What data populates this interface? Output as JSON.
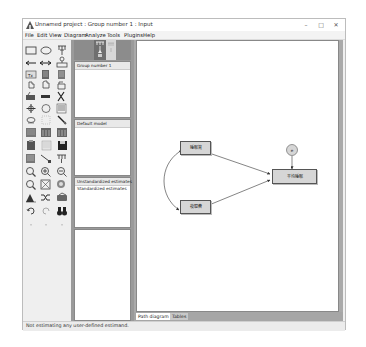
{
  "window": {
    "title": "Unnamed project : Group number 1 : Input",
    "controls": {
      "minimize": "–",
      "maximize": "□",
      "close": "✕"
    }
  },
  "menubar": {
    "items": [
      {
        "label": "File"
      },
      {
        "label": "Edit"
      },
      {
        "label": "View"
      },
      {
        "label": "Diagram"
      },
      {
        "label": "Analyze"
      },
      {
        "label": "Tools"
      },
      {
        "label": "Plugins"
      },
      {
        "label": "Help"
      }
    ]
  },
  "toolbox": {
    "icons": [
      "rectangle-observed-variable-icon",
      "ellipse-latent-variable-icon",
      "indicator-variable-icon",
      "single-arrow-path-icon",
      "double-arrow-covariance-icon",
      "unique-variable-icon",
      "title-icon",
      "list-variables-in-model-icon",
      "list-variables-in-dataset-icon",
      "select-one-object-icon",
      "select-all-objects-icon",
      "deselect-all-icon",
      "duplicate-icon",
      "move-icon",
      "erase-icon",
      "change-shape-icon",
      "rotate-indicators-icon",
      "reflect-indicators-icon",
      "move-parameter-icon",
      "scroll-icon",
      "touch-up-icon",
      "data-files-icon",
      "analysis-properties-icon",
      "calculate-estimates-icon",
      "copy-to-clipboard-icon",
      "view-text-icon",
      "save-icon",
      "object-properties-icon",
      "drag-properties-icon",
      "preserve-symmetries-icon",
      "zoom-in-area-icon",
      "zoom-in-icon",
      "zoom-out-icon",
      "show-whole-page-icon",
      "resize-diagram-icon",
      "magnify-icon",
      "degrees-of-freedom-icon",
      "link-objects-icon",
      "specification-search-icon",
      "undo-icon",
      "redo-icon",
      "binoculars-search-icon"
    ]
  },
  "panels": {
    "groups": {
      "header": "Group number 1"
    },
    "models": {
      "header": "Default model"
    },
    "estimates": {
      "items": [
        "Unstandardized estimates",
        "Standardized estimates"
      ]
    }
  },
  "diagram": {
    "nodes": [
      {
        "id": "x1",
        "label": "睡眠質",
        "type": "observed"
      },
      {
        "id": "x2",
        "label": "夜間費",
        "type": "observed"
      },
      {
        "id": "y",
        "label": "平均睡眠",
        "type": "observed"
      },
      {
        "id": "e",
        "label": "e",
        "type": "error"
      }
    ],
    "colors": {
      "node_fill": "#d6d6d6",
      "node_border": "#555555",
      "arrow": "#333333"
    }
  },
  "tabs": [
    {
      "label": "Path diagram",
      "active": true
    },
    {
      "label": "Tables",
      "active": false
    }
  ],
  "status": {
    "text": "Not estimating any user-defined estimand."
  }
}
